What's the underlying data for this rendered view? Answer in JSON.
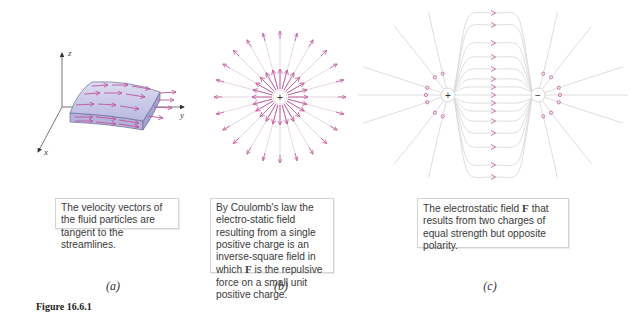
{
  "figure": {
    "number_label": "Figure 16.6.1",
    "colors": {
      "field_line": "#d9d9d9",
      "arrow": "#c0559a",
      "slab_fill": "#c9c9ea",
      "slab_edge": "#6d6d9a",
      "axis": "#444444"
    },
    "panels": [
      {
        "id": "a",
        "label": "(a)",
        "axes": {
          "x": "x",
          "y": "y",
          "z": "z"
        },
        "description_parts": [
          "The velocity vectors of the fluid particles are tangent to the streamlines."
        ]
      },
      {
        "id": "b",
        "label": "(b)",
        "charge_symbol": "+",
        "ray_count": 24,
        "description_parts": [
          "By Coulomb's law the electro-static field resulting from a single positive charge is an inverse-square field in which ",
          "F",
          " is the repulsive force on a small unit positive charge."
        ]
      },
      {
        "id": "c",
        "label": "(c)",
        "positive_charge_symbol": "+",
        "negative_charge_symbol": "−",
        "description_parts": [
          "The electrostatic field ",
          "F",
          " that results from two charges of equal strength but opposite polarity."
        ]
      }
    ]
  }
}
